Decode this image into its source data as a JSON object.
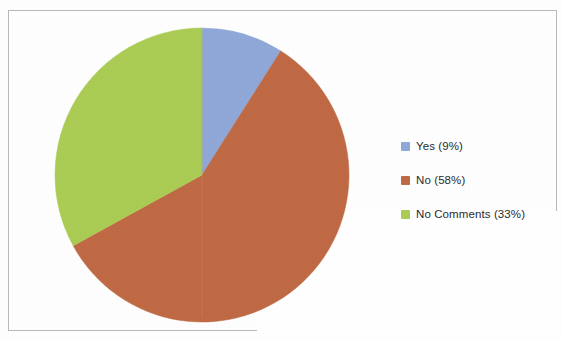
{
  "figure": {
    "background_color": "#fefefe",
    "frame_color": "#b9b9b9"
  },
  "legend": {
    "position": "right",
    "entries": [
      {
        "label": "Yes (9%)",
        "swatch_name": "legend-swatch-yes",
        "color": "#8fa8d8"
      },
      {
        "label": "No (58%)",
        "swatch_name": "legend-swatch-no",
        "color": "#bf6a45"
      },
      {
        "label": "No Comments (33%)",
        "swatch_name": "legend-swatch-no-comments",
        "color": "#aacc55"
      }
    ]
  },
  "chart_data": {
    "type": "pie",
    "title": "",
    "subtitle": "",
    "xlabel": "",
    "ylabel": "",
    "legend_position": "right",
    "grid": false,
    "start_angle_deg": 0,
    "direction": "clockwise",
    "categories": [
      "Yes",
      "No",
      "No Comments"
    ],
    "values": [
      9,
      58,
      33
    ],
    "value_unit": "percent",
    "labels": [
      "Yes (9%)",
      "No (58%)",
      "No Comments (33%)"
    ],
    "colors": [
      "#8fa8d8",
      "#bf6a45",
      "#aacc55"
    ],
    "slices": [
      {
        "label": "Yes",
        "value": 9,
        "display": "Yes (9%)",
        "color": "#8fa8d8",
        "start_deg": 0.0,
        "end_deg": 32.4
      },
      {
        "label": "No",
        "value": 58,
        "display": "No (58%)",
        "color": "#bf6a45",
        "start_deg": 32.4,
        "end_deg": 241.2
      },
      {
        "label": "No Comments",
        "value": 33,
        "display": "No Comments (33%)",
        "color": "#aacc55",
        "start_deg": 241.2,
        "end_deg": 360.0
      }
    ]
  }
}
